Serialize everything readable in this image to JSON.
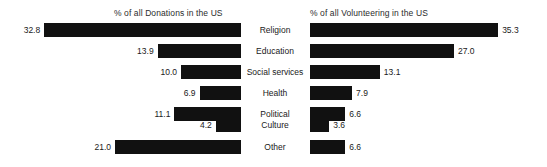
{
  "chart_data": {
    "type": "bar",
    "title": "",
    "orientation": "horizontal",
    "layout": "paired-diverging-bar",
    "grid": false,
    "legend": "none",
    "categories": [
      "Religion",
      "Education",
      "Social services",
      "Health",
      "Political",
      "Culture",
      "Other"
    ],
    "series": [
      {
        "name": "% of all Donations in the US",
        "side": "left",
        "direction": "right-to-left",
        "values": [
          32.8,
          13.9,
          10.0,
          6.9,
          11.1,
          4.2,
          21.0
        ],
        "labels": [
          "32.8",
          "13.9",
          "10.0",
          "6.9",
          "11.1",
          "4.2",
          "21.0"
        ],
        "xlabel": "",
        "ylabel": "",
        "xlim": [
          0,
          35.3
        ]
      },
      {
        "name": "% of all Volunteering in the US",
        "side": "right",
        "direction": "left-to-right",
        "values": [
          35.3,
          27.0,
          13.1,
          7.9,
          6.6,
          3.6,
          6.6
        ],
        "labels": [
          "35.3",
          "27.0",
          "13.1",
          "7.9",
          "6.6",
          "3.6",
          "6.6"
        ],
        "xlabel": "",
        "ylabel": "",
        "xlim": [
          0,
          35.3
        ]
      }
    ],
    "bar_color": "#111111",
    "background_color": "#ffffff"
  },
  "panels": {
    "left_title": "% of all Donations in the US",
    "right_title": "% of all Volunteering in the US"
  },
  "rows": [
    {
      "category": "Religion",
      "left_value": 32.8,
      "left_label": "32.8",
      "right_value": 35.3,
      "right_label": "35.3"
    },
    {
      "category": "Education",
      "left_value": 13.9,
      "left_label": "13.9",
      "right_value": 27.0,
      "right_label": "27.0"
    },
    {
      "category": "Social services",
      "left_value": 10.0,
      "left_label": "10.0",
      "right_value": 13.1,
      "right_label": "13.1"
    },
    {
      "category": "Health",
      "left_value": 6.9,
      "left_label": "6.9",
      "right_value": 7.9,
      "right_label": "7.9"
    },
    {
      "category": "Political",
      "left_value": 11.1,
      "left_label": "11.1",
      "right_value": 6.6,
      "right_label": "6.6"
    },
    {
      "category": "Culture",
      "left_value": 4.2,
      "left_label": "4.2",
      "right_value": 3.6,
      "right_label": "3.6"
    },
    {
      "category": "Other",
      "left_value": 21.0,
      "left_label": "21.0",
      "right_value": 6.6,
      "right_label": "6.6"
    }
  ],
  "geometry": {
    "row_tops": [
      23,
      44,
      65,
      86,
      107,
      118,
      140
    ],
    "left_axis_right_px": 241,
    "left_px_per_unit": 6.0,
    "right_axis_left_px": 310,
    "right_px_per_unit": 5.33,
    "bar_height_px": 14
  }
}
